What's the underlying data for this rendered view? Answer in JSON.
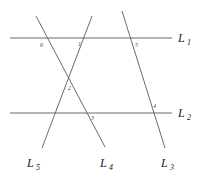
{
  "figure": {
    "type": "geometry-diagram",
    "background_color": "#ffffff",
    "line_color": "#6b6b6b",
    "label_color": "#1a1a1a",
    "angle_label_color": "#4a4a4a"
  },
  "lines": [
    {
      "id": "L1",
      "name": "horizontal-line-l1",
      "label_base": "L",
      "label_sub": "1",
      "orientation": "horizontal",
      "x1": 10,
      "y1": 38,
      "x2": 172,
      "y2": 38,
      "label_x": 178,
      "label_y": 42
    },
    {
      "id": "L2",
      "name": "horizontal-line-l2",
      "label_base": "L",
      "label_sub": "2",
      "orientation": "horizontal",
      "x1": 10,
      "y1": 113,
      "x2": 172,
      "y2": 113,
      "label_x": 178,
      "label_y": 117
    },
    {
      "id": "L3",
      "name": "transversal-line-l3",
      "label_base": "L",
      "label_sub": "3",
      "orientation": "transversal",
      "x1": 122,
      "y1": 11,
      "x2": 165,
      "y2": 148,
      "label_x": 161,
      "label_y": 167
    },
    {
      "id": "L4",
      "name": "transversal-line-l4",
      "label_base": "L",
      "label_sub": "4",
      "orientation": "transversal",
      "x1": 36,
      "y1": 16,
      "x2": 105,
      "y2": 147,
      "label_x": 100,
      "label_y": 167
    },
    {
      "id": "L5",
      "name": "transversal-line-l5",
      "label_base": "L",
      "label_sub": "5",
      "orientation": "transversal",
      "x1": 92,
      "y1": 16,
      "x2": 42,
      "y2": 148,
      "label_x": 27,
      "label_y": 167
    }
  ],
  "angles": [
    {
      "id": "angle-6",
      "label": "6",
      "x": 40,
      "y": 47
    },
    {
      "id": "angle-1",
      "label": "1",
      "x": 78,
      "y": 46
    },
    {
      "id": "angle-5",
      "label": "5",
      "x": 135,
      "y": 47
    },
    {
      "id": "angle-2",
      "label": "2",
      "x": 68,
      "y": 90
    },
    {
      "id": "angle-3",
      "label": "3",
      "x": 91,
      "y": 120
    },
    {
      "id": "angle-4",
      "label": "4",
      "x": 153,
      "y": 108
    }
  ]
}
